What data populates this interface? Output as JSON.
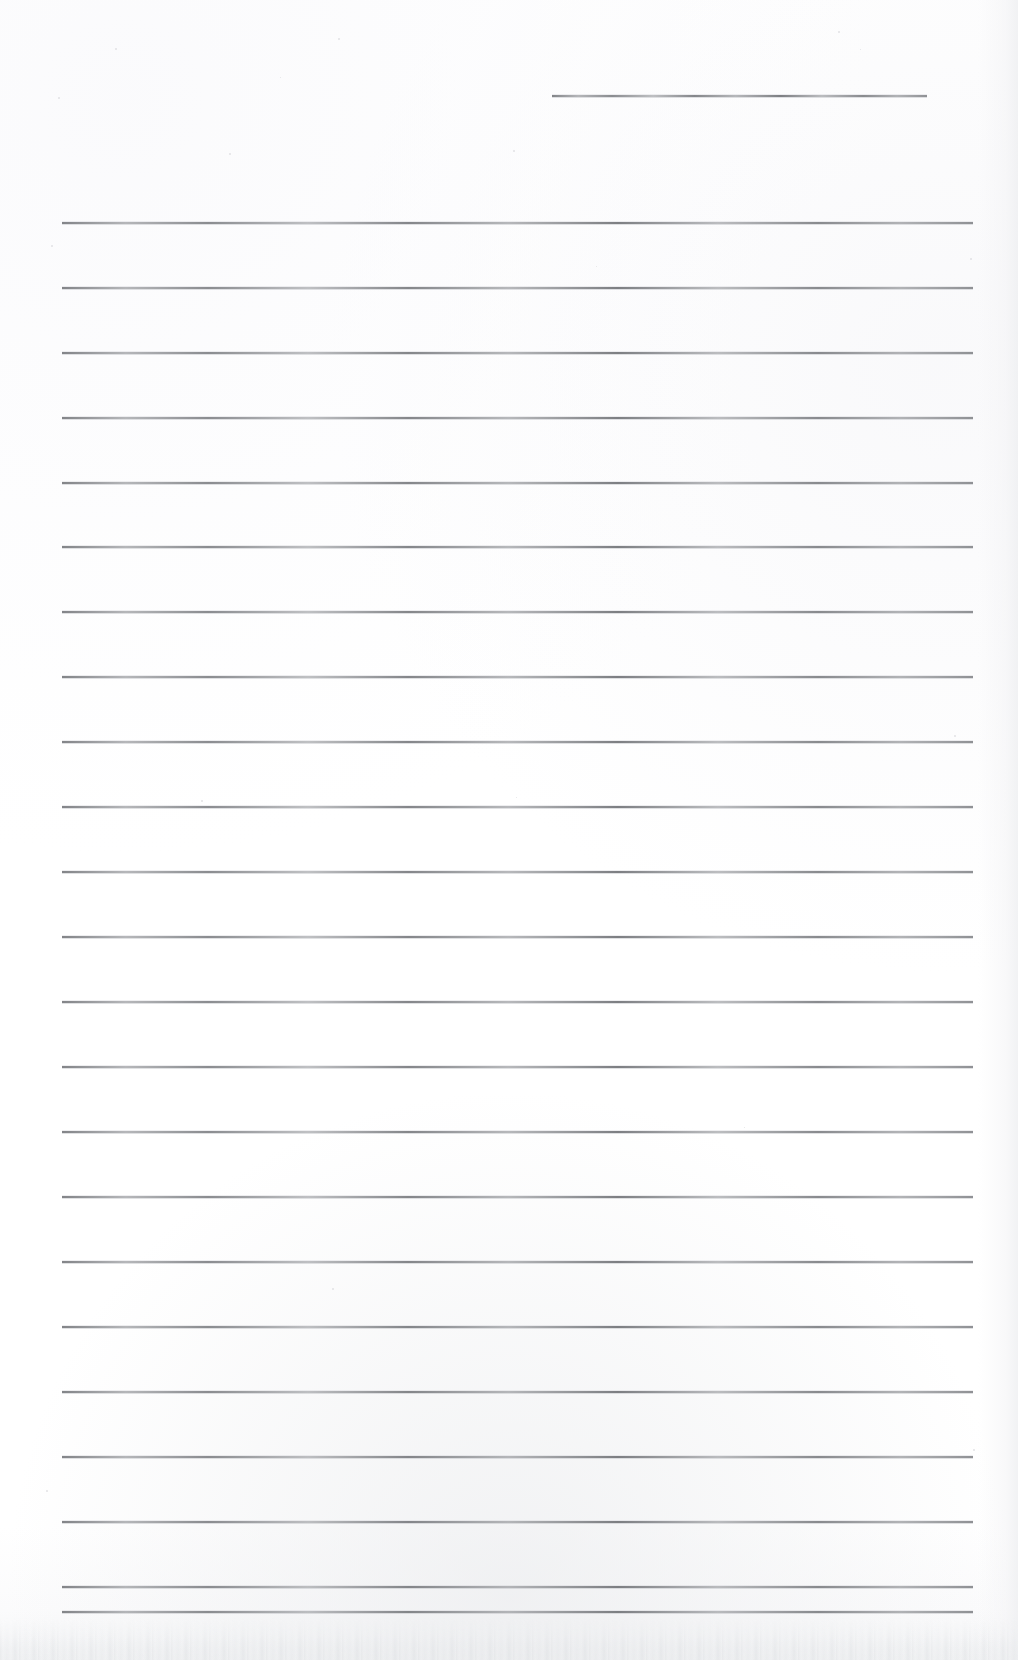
{
  "document": {
    "type": "scanned-lined-paper",
    "title": "Blank Ruled Notepaper Scan",
    "page_width": 1018,
    "page_height": 1660,
    "background_color": "#ffffff",
    "rule_color": "#7d7f83",
    "rule_thickness": 2,
    "rule_spacing": 65,
    "content_text": "",
    "header_line": {
      "name": "header-rule",
      "label": "Header entry line",
      "x": 552,
      "y": 95,
      "width": 375
    },
    "body_lines_x": 62,
    "body_lines_width": 911,
    "body_lines": [
      {
        "index": 1,
        "y": 222
      },
      {
        "index": 2,
        "y": 287
      },
      {
        "index": 3,
        "y": 352
      },
      {
        "index": 4,
        "y": 417
      },
      {
        "index": 5,
        "y": 482
      },
      {
        "index": 6,
        "y": 546
      },
      {
        "index": 7,
        "y": 611
      },
      {
        "index": 8,
        "y": 676
      },
      {
        "index": 9,
        "y": 741
      },
      {
        "index": 10,
        "y": 806
      },
      {
        "index": 11,
        "y": 871
      },
      {
        "index": 12,
        "y": 936
      },
      {
        "index": 13,
        "y": 1001
      },
      {
        "index": 14,
        "y": 1066
      },
      {
        "index": 15,
        "y": 1131
      },
      {
        "index": 16,
        "y": 1196
      },
      {
        "index": 17,
        "y": 1261
      },
      {
        "index": 18,
        "y": 1326
      },
      {
        "index": 19,
        "y": 1391
      },
      {
        "index": 20,
        "y": 1456
      },
      {
        "index": 21,
        "y": 1521
      },
      {
        "index": 22,
        "y": 1586
      },
      {
        "index": 23,
        "y": 1611
      }
    ],
    "specks": [
      {
        "x": 115,
        "y": 48,
        "size": 2
      },
      {
        "x": 338,
        "y": 38,
        "size": 2
      },
      {
        "x": 838,
        "y": 31,
        "size": 2
      },
      {
        "x": 860,
        "y": 49,
        "size": 1
      },
      {
        "x": 58,
        "y": 97,
        "size": 2
      },
      {
        "x": 280,
        "y": 77,
        "size": 1
      },
      {
        "x": 229,
        "y": 153,
        "size": 2
      },
      {
        "x": 513,
        "y": 150,
        "size": 2
      },
      {
        "x": 51,
        "y": 245,
        "size": 2
      },
      {
        "x": 970,
        "y": 258,
        "size": 2
      },
      {
        "x": 596,
        "y": 266,
        "size": 1
      },
      {
        "x": 201,
        "y": 800,
        "size": 2
      },
      {
        "x": 516,
        "y": 797,
        "size": 1
      },
      {
        "x": 954,
        "y": 735,
        "size": 2
      },
      {
        "x": 332,
        "y": 1288,
        "size": 2
      },
      {
        "x": 744,
        "y": 1127,
        "size": 1
      },
      {
        "x": 46,
        "y": 1490,
        "size": 2
      },
      {
        "x": 973,
        "y": 1449,
        "size": 2
      }
    ]
  }
}
